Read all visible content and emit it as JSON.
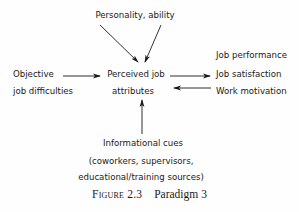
{
  "diagram": {
    "nodes": {
      "top": "Personality, ability",
      "left_line1": "Objective",
      "left_line2": "job difficulties",
      "center_line1": "Perceived job",
      "center_line2": "attributes",
      "right_line1": "Job performance",
      "right_line2": "Job satisfaction",
      "right_line3": "Work motivation",
      "bottom_line1": "Informational cues",
      "bottom_line2": "(coworkers, supervisors,",
      "bottom_line3": "educational/training sources)"
    },
    "edges": [
      {
        "from": "Personality, ability",
        "to": "Perceived job attributes"
      },
      {
        "from": "Objective job difficulties",
        "to": "Perceived job attributes"
      },
      {
        "from": "Perceived job attributes",
        "to": "Job performance / Job satisfaction / Work motivation"
      },
      {
        "from": "Work motivation",
        "to": "Perceived job attributes"
      },
      {
        "from": "Informational cues",
        "to": "Perceived job attributes"
      }
    ],
    "caption": {
      "label": "Figure 2.3",
      "title": "Paradigm 3"
    }
  }
}
